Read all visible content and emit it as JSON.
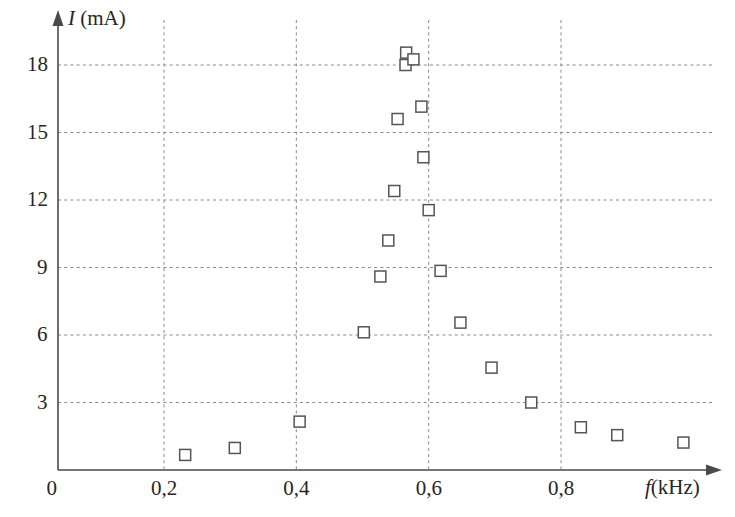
{
  "chart_data": {
    "type": "scatter",
    "title": "",
    "xlabel": "f (kHz)",
    "ylabel": "I (mA)",
    "xlabel_symbol": "f",
    "xlabel_unit": "(kHz)",
    "ylabel_symbol": "I",
    "ylabel_unit": "(mA)",
    "grid": true,
    "legend": "none",
    "xlim": [
      0.0,
      1.06
    ],
    "ylim": [
      0.0,
      20.2
    ],
    "x_ticks": [
      0.2,
      0.4,
      0.6,
      0.8
    ],
    "x_tick_labels": [
      "0,2",
      "0,4",
      "0,6",
      "0,8"
    ],
    "y_ticks": [
      3,
      6,
      9,
      12,
      15,
      18
    ],
    "y_tick_labels": [
      "3",
      "6",
      "9",
      "12",
      "15",
      "18"
    ],
    "origin_label": "0",
    "marker_style": "open-square",
    "marker_color": "#555555",
    "points": [
      {
        "x": 0.232,
        "y": 0.67
      },
      {
        "x": 0.307,
        "y": 0.98
      },
      {
        "x": 0.405,
        "y": 2.15
      },
      {
        "x": 0.502,
        "y": 6.12
      },
      {
        "x": 0.527,
        "y": 8.6
      },
      {
        "x": 0.539,
        "y": 10.2
      },
      {
        "x": 0.548,
        "y": 12.4
      },
      {
        "x": 0.553,
        "y": 15.6
      },
      {
        "x": 0.565,
        "y": 18.0
      },
      {
        "x": 0.566,
        "y": 18.55
      },
      {
        "x": 0.577,
        "y": 18.25
      },
      {
        "x": 0.589,
        "y": 16.15
      },
      {
        "x": 0.592,
        "y": 13.9
      },
      {
        "x": 0.6,
        "y": 11.55
      },
      {
        "x": 0.618,
        "y": 8.85
      },
      {
        "x": 0.648,
        "y": 6.55
      },
      {
        "x": 0.695,
        "y": 4.55
      },
      {
        "x": 0.755,
        "y": 3.0
      },
      {
        "x": 0.83,
        "y": 1.9
      },
      {
        "x": 0.885,
        "y": 1.55
      },
      {
        "x": 0.985,
        "y": 1.22
      }
    ]
  }
}
